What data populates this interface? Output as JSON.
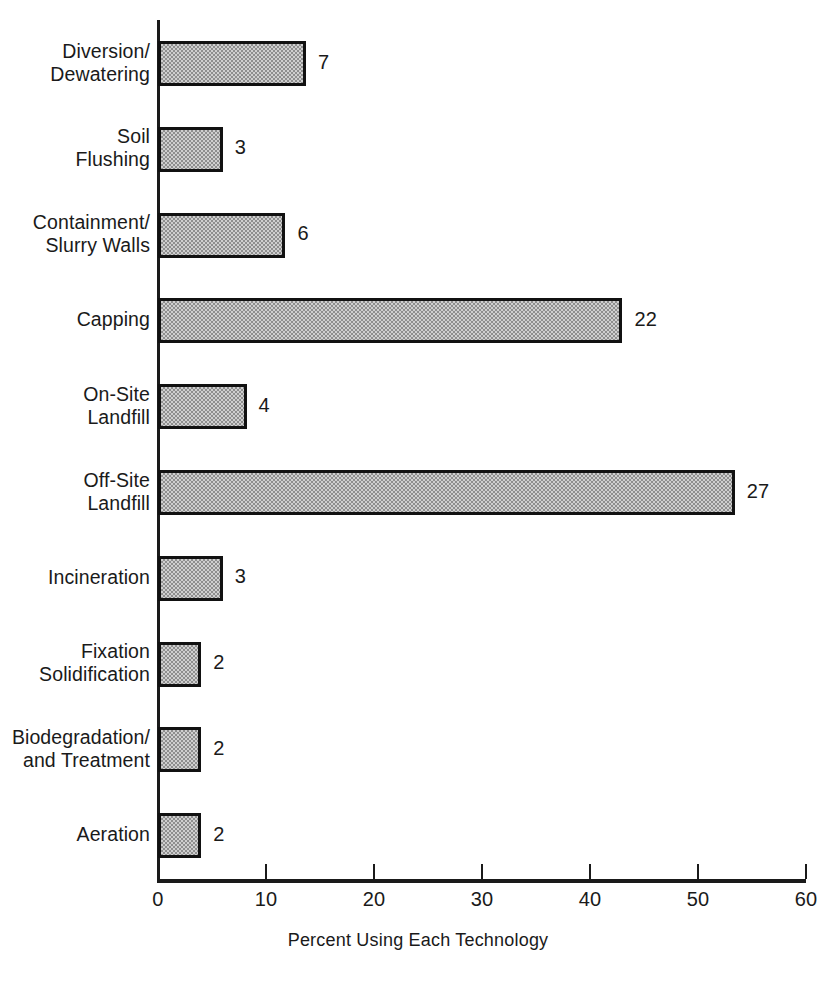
{
  "chart_data": {
    "type": "bar",
    "orientation": "horizontal",
    "title": "",
    "xlabel": "Percent Using Each Technology",
    "ylabel": "",
    "xlim": [
      0,
      60
    ],
    "xticks": [
      0,
      10,
      20,
      30,
      40,
      50,
      60
    ],
    "xtick_labels": [
      "0",
      "10",
      "20",
      "30",
      "40",
      "50",
      "60"
    ],
    "grid": false,
    "legend": false,
    "categories": [
      "Diversion/\nDewatering",
      "Soil\nFlushing",
      "Containment/\nSlurry Walls",
      "Capping",
      "On-Site\nLandfill",
      "Off-Site\nLandfill",
      "Incineration",
      "Fixation\nSolidification",
      "Biodegradation/\nand Treatment",
      "Aeration"
    ],
    "values": [
      7,
      3,
      6,
      22,
      4,
      27,
      3,
      2,
      2,
      2
    ],
    "bar_percent": [
      13.7,
      6.0,
      11.8,
      43.0,
      8.2,
      53.4,
      6.0,
      4.0,
      4.0,
      4.0
    ],
    "data_labels": [
      "7",
      "3",
      "6",
      "22",
      "4",
      "27",
      "3",
      "2",
      "2",
      "2"
    ],
    "colors": {
      "bar_fill": "#cfcfcf",
      "bar_pattern": "#8e8e8e",
      "bar_edge": "#111111",
      "axis": "#1a1a1a",
      "text": "#1a1a1a",
      "background": "#ffffff"
    }
  },
  "axis": {
    "x_title": "Percent Using Each Technology"
  }
}
